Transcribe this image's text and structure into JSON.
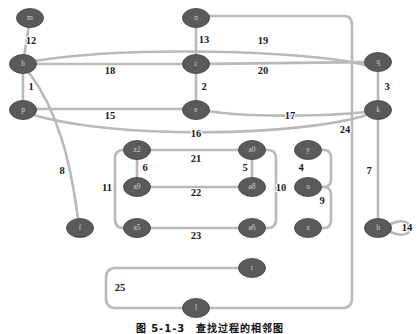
{
  "figure": {
    "caption": "图 5-1-3　查找过程的相邻图",
    "node_fill": "#5a5a5a",
    "edge_color": "#b9b9b9",
    "background": "#ffffff"
  },
  "graph": {
    "type": "undirected-graph",
    "node_count": 21,
    "edge_count": 25,
    "nodes": [
      {
        "id": "m",
        "label": "m",
        "x": 30,
        "y": 18
      },
      {
        "id": "n",
        "label": "n",
        "x": 196,
        "y": 18
      },
      {
        "id": "q",
        "label": "q",
        "x": 378,
        "y": 62
      },
      {
        "id": "b",
        "label": "b",
        "x": 23,
        "y": 64
      },
      {
        "id": "c",
        "label": "c",
        "x": 196,
        "y": 64
      },
      {
        "id": "p",
        "label": "p",
        "x": 23,
        "y": 110
      },
      {
        "id": "e",
        "label": "e",
        "x": 196,
        "y": 110
      },
      {
        "id": "k",
        "label": "k",
        "x": 378,
        "y": 110
      },
      {
        "id": "f",
        "label": "f",
        "x": 80,
        "y": 228
      },
      {
        "id": "z2",
        "label": "z2",
        "x": 137,
        "y": 150
      },
      {
        "id": "a0",
        "label": "a0",
        "x": 252,
        "y": 150
      },
      {
        "id": "y",
        "label": "y",
        "x": 308,
        "y": 150
      },
      {
        "id": "a9",
        "label": "a9",
        "x": 137,
        "y": 187
      },
      {
        "id": "a8",
        "label": "a8",
        "x": 252,
        "y": 187
      },
      {
        "id": "u",
        "label": "u",
        "x": 308,
        "y": 187
      },
      {
        "id": "a5",
        "label": "a5",
        "x": 137,
        "y": 228
      },
      {
        "id": "a6",
        "label": "a6",
        "x": 252,
        "y": 228
      },
      {
        "id": "x",
        "label": "x",
        "x": 308,
        "y": 228
      },
      {
        "id": "h",
        "label": "h",
        "x": 378,
        "y": 228
      },
      {
        "id": "r",
        "label": "r",
        "x": 252,
        "y": 268
      },
      {
        "id": "l",
        "label": "l",
        "x": 196,
        "y": 308
      }
    ],
    "edges": [
      {
        "id": 1,
        "label": "1",
        "from": "b",
        "to": "p",
        "label_x": 31,
        "label_y": 88
      },
      {
        "id": 2,
        "label": "2",
        "from": "c",
        "to": "e",
        "label_x": 204,
        "label_y": 88
      },
      {
        "id": 3,
        "label": "3",
        "from": "q",
        "to": "k",
        "label_x": 387,
        "label_y": 88
      },
      {
        "id": 4,
        "label": "4",
        "from": "y",
        "to": "u",
        "label_x": 301,
        "label_y": 169
      },
      {
        "id": 5,
        "label": "5",
        "from": "a0",
        "to": "a8",
        "label_x": 245,
        "label_y": 169
      },
      {
        "id": 6,
        "label": "6",
        "from": "z2",
        "to": "a9",
        "label_x": 145,
        "label_y": 169
      },
      {
        "id": 7,
        "label": "7",
        "from": "k",
        "to": "h",
        "label_x": 369,
        "label_y": 172
      },
      {
        "id": 8,
        "label": "8",
        "from": "b",
        "to": "f",
        "label_x": 62,
        "label_y": 172
      },
      {
        "id": 9,
        "label": "9",
        "from": "u",
        "to": "x",
        "label_x": 322,
        "label_y": 202
      },
      {
        "id": 10,
        "label": "10",
        "from": "a0",
        "to": "a6",
        "label_x": 281,
        "label_y": 189
      },
      {
        "id": 11,
        "label": "11",
        "from": "z2",
        "to": "a5",
        "label_x": 107,
        "label_y": 189
      },
      {
        "id": 12,
        "label": "12",
        "from": "m",
        "to": "b",
        "label_x": 31,
        "label_y": 42
      },
      {
        "id": 13,
        "label": "13",
        "from": "n",
        "to": "c",
        "label_x": 204,
        "label_y": 41
      },
      {
        "id": 14,
        "label": "14",
        "from": "h",
        "to": "h",
        "label_x": 407,
        "label_y": 229
      },
      {
        "id": 15,
        "label": "15",
        "from": "p",
        "to": "e",
        "label_x": 110,
        "label_y": 117
      },
      {
        "id": 16,
        "label": "16",
        "from": "p",
        "to": "k",
        "label_x": 196,
        "label_y": 135
      },
      {
        "id": 17,
        "label": "17",
        "from": "e",
        "to": "k",
        "label_x": 290,
        "label_y": 117
      },
      {
        "id": 18,
        "label": "18",
        "from": "b",
        "to": "c",
        "label_x": 110,
        "label_y": 72
      },
      {
        "id": 19,
        "label": "19",
        "from": "b",
        "to": "q",
        "label_x": 263,
        "label_y": 42
      },
      {
        "id": 20,
        "label": "20",
        "from": "c",
        "to": "q",
        "label_x": 263,
        "label_y": 72
      },
      {
        "id": 21,
        "label": "21",
        "from": "z2",
        "to": "a0",
        "label_x": 196,
        "label_y": 160
      },
      {
        "id": 22,
        "label": "22",
        "from": "a9",
        "to": "a8",
        "label_x": 196,
        "label_y": 194
      },
      {
        "id": 23,
        "label": "23",
        "from": "a5",
        "to": "a6",
        "label_x": 196,
        "label_y": 237
      },
      {
        "id": 24,
        "label": "24",
        "from": "n",
        "to": "l",
        "label_x": 345,
        "label_y": 131
      },
      {
        "id": 25,
        "label": "25",
        "from": "r",
        "to": "l",
        "label_x": 120,
        "label_y": 289
      }
    ]
  }
}
